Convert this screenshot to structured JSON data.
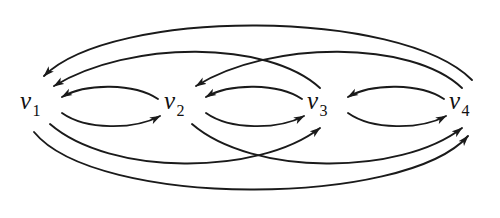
{
  "figure": {
    "type": "directed-graph",
    "background_color": "#ffffff",
    "stroke_color": "#1a1a1a",
    "label_color": "#111111",
    "width": 500,
    "height": 218
  },
  "vertices": [
    {
      "id": "v1",
      "base": "v",
      "subscript": "1",
      "x": 42,
      "y": 104
    },
    {
      "id": "v2",
      "base": "v",
      "subscript": "2",
      "x": 185,
      "y": 104
    },
    {
      "id": "v3",
      "base": "v",
      "subscript": "3",
      "x": 328,
      "y": 104
    },
    {
      "id": "v4",
      "base": "v",
      "subscript": "4",
      "x": 470,
      "y": 104
    }
  ],
  "edges": [
    {
      "id": "e-v1-v2",
      "from": "v1",
      "to": "v2",
      "style": "short-lower-arc",
      "direction": "rightward"
    },
    {
      "id": "e-v2-v1",
      "from": "v2",
      "to": "v1",
      "style": "short-upper-arc",
      "direction": "leftward"
    },
    {
      "id": "e-v2-v3",
      "from": "v2",
      "to": "v3",
      "style": "short-lower-arc",
      "direction": "rightward"
    },
    {
      "id": "e-v3-v2",
      "from": "v3",
      "to": "v2",
      "style": "short-upper-arc",
      "direction": "leftward"
    },
    {
      "id": "e-v3-v4",
      "from": "v3",
      "to": "v4",
      "style": "short-lower-arc",
      "direction": "rightward"
    },
    {
      "id": "e-v4-v3",
      "from": "v4",
      "to": "v3",
      "style": "short-upper-arc",
      "direction": "leftward"
    },
    {
      "id": "e-v3-v1",
      "from": "v3",
      "to": "v1",
      "style": "long-upper-arc",
      "direction": "leftward"
    },
    {
      "id": "e-v4-v2",
      "from": "v4",
      "to": "v2",
      "style": "long-upper-arc",
      "direction": "leftward"
    },
    {
      "id": "e-v4-v1",
      "from": "v4",
      "to": "v1",
      "style": "outer-upper-arc",
      "direction": "leftward"
    },
    {
      "id": "e-v1-v3",
      "from": "v1",
      "to": "v3",
      "style": "long-lower-arc",
      "direction": "rightward"
    },
    {
      "id": "e-v2-v4",
      "from": "v2",
      "to": "v4",
      "style": "long-lower-arc",
      "direction": "rightward"
    },
    {
      "id": "e-v1-v4",
      "from": "v1",
      "to": "v4",
      "style": "outer-lower-arc",
      "direction": "rightward"
    }
  ]
}
